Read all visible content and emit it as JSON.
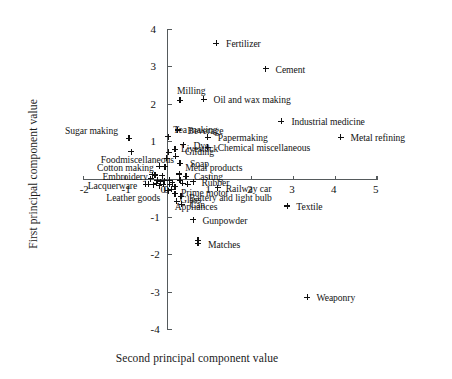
{
  "chart_data": {
    "type": "scatter",
    "title": "",
    "xlabel": "Second principal component value",
    "ylabel": "First principal component value",
    "xlim": [
      -2,
      5
    ],
    "ylim": [
      -4,
      4
    ],
    "xticks": [
      -2,
      -1,
      0,
      1,
      2,
      3,
      4,
      5
    ],
    "xticklabels": [
      "-2",
      "-1",
      "0",
      "1",
      "2",
      "3",
      "4",
      "5"
    ],
    "yticks": [
      -4,
      -3,
      -2,
      -1,
      0,
      1,
      2,
      3,
      4
    ],
    "yticklabels": [
      "-4",
      "-3",
      "-2",
      "-1",
      "0",
      "1",
      "2",
      "3",
      "4"
    ],
    "grid": false,
    "legend": false,
    "marker": "plus",
    "marker_color": "#101010",
    "axis_color": "#555a5c",
    "points": [
      {
        "label": "Fertilizer",
        "x": 1.16,
        "y": 3.63,
        "lx": 10,
        "ly": -4
      },
      {
        "label": "Cement",
        "x": 2.34,
        "y": 2.95,
        "lx": 10,
        "ly": -4
      },
      {
        "label": "Milling",
        "x": 0.3,
        "y": 2.11,
        "lx": -3,
        "ly": -14
      },
      {
        "label": "Oil and wax making",
        "x": 0.86,
        "y": 2.13,
        "lx": 10,
        "ly": -4
      },
      {
        "label": "Industrial medicine",
        "x": 2.72,
        "y": 1.55,
        "lx": 10,
        "ly": -4
      },
      {
        "label": "Beverage",
        "x": 0.24,
        "y": 1.32,
        "lx": 10,
        "ly": -4
      },
      {
        "label": "Sugar making",
        "x": -0.92,
        "y": 1.1,
        "lx": -64,
        "ly": -12
      },
      {
        "label": "Metal refining",
        "x": 4.13,
        "y": 1.13,
        "lx": 10,
        "ly": -4
      },
      {
        "label": "Tea making",
        "x": 0.02,
        "y": 1.14,
        "lx": 5,
        "ly": -12
      },
      {
        "label": "Papermaking",
        "x": 0.96,
        "y": 1.12,
        "lx": 10,
        "ly": -4
      },
      {
        "label": "Dye",
        "x": 0.38,
        "y": 0.93,
        "lx": 10,
        "ly": -4
      },
      {
        "label": "Chemical miscellaneous",
        "x": 0.96,
        "y": 0.86,
        "lx": 10,
        "ly": -4
      },
      {
        "label": "Gilding",
        "x": 0.18,
        "y": 0.8,
        "lx": 10,
        "ly": -2
      },
      {
        "label": "Livestock",
        "x": 0.2,
        "y": 0.62,
        "lx": 5,
        "ly": -12
      },
      {
        "label": "Foodmiscellaneous",
        "x": -0.02,
        "y": 0.56,
        "lx": -66,
        "ly": -3
      },
      {
        "label": "Soap",
        "x": 0.3,
        "y": 0.43,
        "lx": 10,
        "ly": -4
      },
      {
        "label": "Cotton making",
        "x": -0.2,
        "y": 0.35,
        "lx": -62,
        "ly": -3
      },
      {
        "label": "Metal products",
        "x": 0.28,
        "y": 0.15,
        "lx": 6,
        "ly": -11
      },
      {
        "label": "Embroidery",
        "x": -0.36,
        "y": 0.13,
        "lx": -50,
        "ly": -3
      },
      {
        "label": "Casting",
        "x": 0.44,
        "y": 0.08,
        "lx": 8,
        "ly": -4
      },
      {
        "label": "Rubber",
        "x": 0.62,
        "y": -0.06,
        "lx": 8,
        "ly": -4
      },
      {
        "label": "Lacquerware",
        "x": -0.52,
        "y": -0.13,
        "lx": -58,
        "ly": -3
      },
      {
        "label": "Prime motor",
        "x": 0.18,
        "y": -0.19,
        "lx": 6,
        "ly": 1
      },
      {
        "label": "Leather goods",
        "x": 0.02,
        "y": -0.3,
        "lx": -62,
        "ly": 2
      },
      {
        "label": "Railway car",
        "x": 1.2,
        "y": -0.22,
        "lx": 8,
        "ly": -4
      },
      {
        "label": "Glass",
        "x": 0.18,
        "y": -0.38,
        "lx": 5,
        "ly": 1
      },
      {
        "label": "Battery and light bulb",
        "x": 0.32,
        "y": -0.44,
        "lx": 8,
        "ly": -3
      },
      {
        "label": "Appliances",
        "x": 0.22,
        "y": -0.58,
        "lx": -2,
        "ly": 1
      },
      {
        "label": "Can",
        "x": 0.34,
        "y": -0.66,
        "lx": 8,
        "ly": -4
      },
      {
        "label": "Textile",
        "x": 2.86,
        "y": -0.7,
        "lx": 9,
        "ly": -4
      },
      {
        "label": "Gunpowder",
        "x": 0.62,
        "y": -1.07,
        "lx": 9,
        "ly": -4
      },
      {
        "label": "Matches",
        "x": 0.73,
        "y": -1.7,
        "lx": 10,
        "ly": -3
      },
      {
        "label": "Weaponry",
        "x": 3.34,
        "y": -3.13,
        "lx": 9,
        "ly": -4
      }
    ],
    "extra_points": [
      {
        "x": -0.86,
        "y": 0.74
      },
      {
        "x": 0.03,
        "y": 0.72
      },
      {
        "x": -0.06,
        "y": 0.34
      },
      {
        "x": -0.3,
        "y": 0.12
      },
      {
        "x": -0.12,
        "y": 0.1
      },
      {
        "x": -0.4,
        "y": 0.02
      },
      {
        "x": -0.24,
        "y": -0.02
      },
      {
        "x": -0.17,
        "y": -0.06
      },
      {
        "x": -0.08,
        "y": -0.03
      },
      {
        "x": 0.04,
        "y": -0.02
      },
      {
        "x": -0.46,
        "y": -0.12
      },
      {
        "x": -0.33,
        "y": -0.14
      },
      {
        "x": -0.27,
        "y": -0.1
      },
      {
        "x": -0.2,
        "y": -0.16
      },
      {
        "x": -0.1,
        "y": -0.12
      },
      {
        "x": 0.05,
        "y": -0.12
      },
      {
        "x": 0.11,
        "y": -0.08
      },
      {
        "x": 0.3,
        "y": -0.02
      },
      {
        "x": 0.36,
        "y": -0.1
      },
      {
        "x": 0.48,
        "y": -0.12
      },
      {
        "x": 0.1,
        "y": -0.26
      },
      {
        "x": 0.73,
        "y": -1.62
      }
    ]
  }
}
